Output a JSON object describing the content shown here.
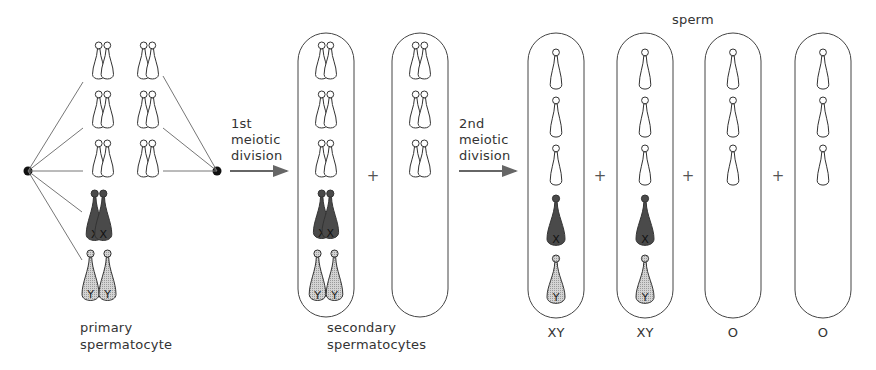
{
  "labels": {
    "primary": [
      "primary",
      "spermatocyte"
    ],
    "first_division": [
      "1st",
      "meiotic",
      "division"
    ],
    "second_division": [
      "2nd",
      "meiotic",
      "division"
    ],
    "secondary": [
      "secondary",
      "spermatocytes"
    ],
    "sperm": "sperm",
    "plus": "+"
  },
  "colors": {
    "stroke": "#333333",
    "x_fill": "#4a4a4a",
    "y_fill": "#c8c8c8",
    "arrow": "#666666",
    "line": "#777777"
  },
  "primary_spermatocyte": {
    "node_left": {
      "x": 28,
      "y": 171
    },
    "node_right": {
      "x": 217,
      "y": 171
    },
    "autosome_pairs": 6,
    "sex_chromosomes": [
      "X",
      "Y"
    ]
  },
  "secondary_spermatocytes": [
    {
      "autosomes": 3,
      "sex": [
        "X",
        "Y"
      ]
    },
    {
      "autosomes": 3,
      "sex": []
    }
  ],
  "sperm_cells": [
    {
      "autosomes": 3,
      "sex": [
        "X",
        "Y"
      ],
      "label": "XY"
    },
    {
      "autosomes": 3,
      "sex": [
        "X",
        "Y"
      ],
      "label": "XY"
    },
    {
      "autosomes": 3,
      "sex": [],
      "label": "O"
    },
    {
      "autosomes": 3,
      "sex": [],
      "label": "O"
    }
  ]
}
